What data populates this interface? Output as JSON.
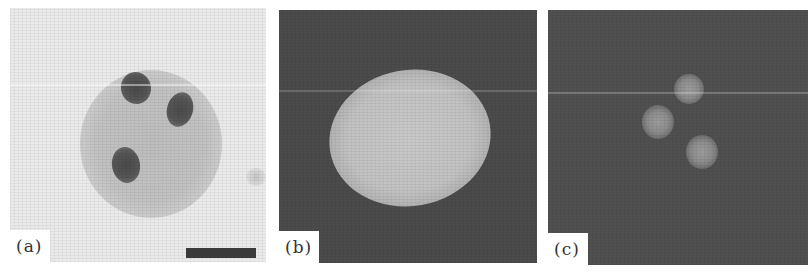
{
  "figure": {
    "panels": [
      {
        "id": "a",
        "label": "(a)",
        "description": "Bright-field image of a round cell with three dark stained bodies",
        "has_scale_bar": true
      },
      {
        "id": "b",
        "label": "(b)",
        "description": "Fluorescence image of a single bright oval nucleus on dark background",
        "has_scale_bar": false
      },
      {
        "id": "c",
        "label": "(c)",
        "description": "Fluorescence image showing three faint bright spots on dark background",
        "has_scale_bar": false
      }
    ],
    "colors": {
      "panel_a_background": "#eaeaea",
      "panel_a_bodies": "#4a4a4a",
      "panel_b_background": "#4b4b4b",
      "panel_b_nucleus": "#c4c4c4",
      "panel_c_background": "#505050",
      "panel_c_spots": "#9a9a9a",
      "scale_bar": "#3a3a3a"
    }
  }
}
